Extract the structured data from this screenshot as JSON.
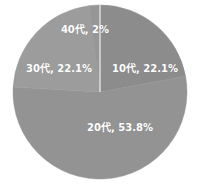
{
  "chart_data": {
    "type": "pie",
    "title": "",
    "categories": [
      "10代",
      "20代",
      "30代",
      "40代"
    ],
    "values": [
      22.1,
      53.8,
      22.1,
      2.0
    ],
    "unit": "%",
    "labels": [
      "10代, 22.1%",
      "20代, 53.8%",
      "30代, 22.1%",
      "40代, 2%"
    ],
    "colors": [
      "#8c8c8c",
      "#939393",
      "#9c9c9c",
      "#969696"
    ],
    "start_angle_deg": 0,
    "direction": "clockwise",
    "legend": "none",
    "data_labels": "inside, category and percent"
  },
  "layout": {
    "center": [
      100,
      92
    ],
    "radius": 87,
    "divider_color": "#ffffff",
    "background": "#ffffff"
  },
  "label_positions": [
    {
      "x": 145,
      "y": 67
    },
    {
      "x": 120,
      "y": 126
    },
    {
      "x": 59,
      "y": 67
    },
    {
      "x": 85,
      "y": 28
    }
  ],
  "label_positions_alt": [
    {
      "x": 145,
      "y": 67
    },
    {
      "x": 120,
      "y": 126
    },
    {
      "x": 59,
      "y": 67
    },
    {
      "x": 97,
      "y": 28
    }
  ]
}
